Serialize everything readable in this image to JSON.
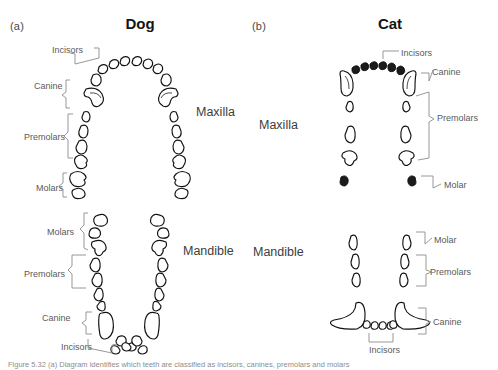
{
  "figure": {
    "panels": [
      {
        "tag": "(a)",
        "species": "Dog",
        "arches": [
          {
            "name": "Maxilla",
            "label": "Maxilla",
            "groups": [
              "Incisors",
              "Canine",
              "Premolars",
              "Molars"
            ]
          },
          {
            "name": "Mandible",
            "label": "Mandible",
            "groups": [
              "Molars",
              "Premolars",
              "Canine",
              "Incisors"
            ]
          }
        ]
      },
      {
        "tag": "(b)",
        "species": "Cat",
        "arches": [
          {
            "name": "Maxilla",
            "label": "Maxilla",
            "groups": [
              "Incisors",
              "Canine",
              "Premolars",
              "Molar"
            ]
          },
          {
            "name": "Mandible",
            "label": "Mandible",
            "groups": [
              "Molar",
              "Premolars",
              "Canine",
              "Incisors"
            ]
          }
        ]
      }
    ],
    "labels": {
      "panel_a_tag": "(a)",
      "panel_b_tag": "(b)",
      "dog_title": "Dog",
      "cat_title": "Cat",
      "dog_maxilla": "Maxilla",
      "dog_mandible": "Mandible",
      "cat_maxilla": "Maxilla",
      "cat_mandible": "Mandible",
      "dog_max_incisors": "Incisors",
      "dog_max_canine": "Canine",
      "dog_max_premolars": "Premolars",
      "dog_max_molars": "Molars",
      "dog_man_molars": "Molars",
      "dog_man_premolars": "Premolars",
      "dog_man_canine": "Canine",
      "dog_man_incisors": "Incisors",
      "cat_max_incisors": "Incisors",
      "cat_max_canine": "Canine",
      "cat_max_premolars": "Premolars",
      "cat_max_molar": "Molar",
      "cat_man_molar": "Molar",
      "cat_man_premolars": "Premolars",
      "cat_man_canine": "Canine",
      "cat_man_incisors": "Incisors"
    },
    "caption": "Figure 5.32  (a) Diagram identifies which teeth are classified as incisors, canines, premolars and molars",
    "colors": {
      "outline": "#111111",
      "label": "#5a5a5a",
      "brace": "#8c8c8c",
      "title": "#141414",
      "background": "#ffffff"
    }
  }
}
